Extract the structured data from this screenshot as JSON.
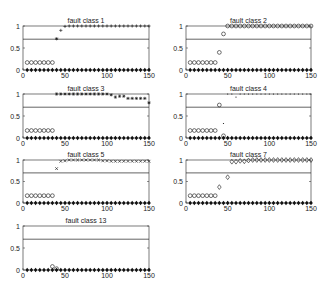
{
  "figure": {
    "background": "#ffffff",
    "line_color": "#222222",
    "marker_color": "#111111"
  },
  "chart_data": [
    {
      "type": "scatter",
      "title": "fault class 1",
      "xlim": [
        0,
        150
      ],
      "ylim": [
        0,
        1
      ],
      "xticks": [
        0,
        50,
        100,
        150
      ],
      "yticks": [
        0,
        0.5,
        1
      ],
      "threshold": 0.7,
      "grid": false,
      "series": [
        {
          "name": "normal",
          "marker": "diamond-filled",
          "x": "5..150 step 5",
          "y": "0 for all"
        },
        {
          "name": "pre-fault",
          "marker": "circle-open",
          "x": [
            5,
            10,
            15,
            20,
            25,
            30,
            35
          ],
          "y": [
            0.17,
            0.17,
            0.17,
            0.17,
            0.17,
            0.17,
            0.17
          ]
        },
        {
          "name": "transition",
          "marker": "asterisk",
          "x": [
            40
          ],
          "y": [
            0.71
          ]
        },
        {
          "name": "fault",
          "marker": "plus",
          "x": [
            45,
            50,
            55,
            60,
            65,
            70,
            75,
            80,
            85,
            90,
            95,
            100,
            105,
            110,
            115,
            120,
            125,
            130,
            135,
            140,
            145,
            150
          ],
          "y": [
            0.9,
            0.99,
            1,
            1,
            1,
            1,
            1,
            1,
            1,
            1,
            1,
            1,
            1,
            1,
            1,
            1,
            1,
            1,
            1,
            1,
            1,
            1
          ]
        }
      ]
    },
    {
      "type": "scatter",
      "title": "fault class 2",
      "xlim": [
        0,
        150
      ],
      "ylim": [
        0,
        1
      ],
      "xticks": [
        0,
        50,
        100,
        150
      ],
      "yticks": [
        0,
        0.5,
        1
      ],
      "threshold": 0.7,
      "grid": false,
      "series": [
        {
          "name": "normal",
          "marker": "diamond-filled",
          "x": "5..150 step 5",
          "y": "0 for all"
        },
        {
          "name": "pre-fault",
          "marker": "circle-open",
          "x": [
            5,
            10,
            15,
            20,
            25,
            30,
            35
          ],
          "y": [
            0.17,
            0.17,
            0.17,
            0.17,
            0.17,
            0.17,
            0.17
          ]
        },
        {
          "name": "fault",
          "marker": "circle-open",
          "x": [
            40,
            45,
            50,
            55,
            60,
            65,
            70,
            75,
            80,
            85,
            90,
            95,
            100,
            105,
            110,
            115,
            120,
            125,
            130,
            135,
            140,
            145,
            150
          ],
          "y": [
            0.4,
            0.82,
            1,
            1,
            1,
            1,
            1,
            1,
            1,
            1,
            1,
            1,
            1,
            1,
            1,
            1,
            1,
            1,
            1,
            1,
            1,
            1,
            1
          ]
        }
      ]
    },
    {
      "type": "scatter",
      "title": "fault class 3",
      "xlim": [
        0,
        150
      ],
      "ylim": [
        0,
        1
      ],
      "xticks": [
        0,
        50,
        100,
        150
      ],
      "yticks": [
        0,
        0.5,
        1
      ],
      "threshold": 0.7,
      "grid": false,
      "series": [
        {
          "name": "normal",
          "marker": "diamond-filled",
          "x": "5..150 step 5",
          "y": "0 for all"
        },
        {
          "name": "pre-fault",
          "marker": "circle-open",
          "x": [
            5,
            10,
            15,
            20,
            25,
            30,
            35
          ],
          "y": [
            0.17,
            0.17,
            0.17,
            0.17,
            0.17,
            0.17,
            0.17
          ]
        },
        {
          "name": "fault",
          "marker": "asterisk",
          "x": [
            40,
            45,
            50,
            55,
            60,
            65,
            70,
            75,
            80,
            85,
            90,
            95,
            100,
            105,
            110,
            115,
            120,
            125,
            130,
            135,
            140,
            145,
            150
          ],
          "y": [
            1,
            1,
            1,
            1,
            1,
            1,
            1,
            1,
            1,
            1,
            1,
            1,
            1,
            0.98,
            0.93,
            0.95,
            0.95,
            0.9,
            0.9,
            0.9,
            0.9,
            0.9,
            0.8
          ]
        }
      ]
    },
    {
      "type": "scatter",
      "title": "fault class 4",
      "xlim": [
        0,
        150
      ],
      "ylim": [
        0,
        1
      ],
      "xticks": [
        0,
        50,
        100,
        150
      ],
      "yticks": [
        0,
        0.5,
        1
      ],
      "threshold": 0.7,
      "grid": false,
      "series": [
        {
          "name": "normal",
          "marker": "diamond-filled",
          "x": "5..150 step 5",
          "y": "0 for all"
        },
        {
          "name": "pre-fault",
          "marker": "circle-open",
          "x": [
            5,
            10,
            15,
            20,
            25,
            30,
            35,
            40,
            45
          ],
          "y": [
            0.17,
            0.17,
            0.17,
            0.17,
            0.17,
            0.17,
            0.17,
            0.75,
            0.05
          ]
        },
        {
          "name": "fault",
          "marker": "dot",
          "x": [
            45,
            50,
            55,
            60,
            65,
            70,
            75,
            80,
            85,
            90,
            95,
            100,
            105,
            110,
            115,
            120,
            125,
            130,
            135,
            140,
            145,
            150
          ],
          "y": [
            0.33,
            1,
            1,
            0.93,
            1,
            1,
            1,
            1,
            1,
            1,
            1,
            1,
            1,
            1,
            1,
            1,
            1,
            1,
            1,
            1,
            1,
            1
          ]
        }
      ]
    },
    {
      "type": "scatter",
      "title": "fault class 5",
      "xlim": [
        0,
        150
      ],
      "ylim": [
        0,
        1
      ],
      "xticks": [
        0,
        50,
        100,
        150
      ],
      "yticks": [
        0,
        0.5,
        1
      ],
      "threshold": 0.7,
      "grid": false,
      "series": [
        {
          "name": "normal",
          "marker": "diamond-filled",
          "x": "5..150 step 5",
          "y": "0 for all"
        },
        {
          "name": "pre-fault",
          "marker": "circle-open",
          "x": [
            5,
            10,
            15,
            20,
            25,
            30,
            35
          ],
          "y": [
            0.17,
            0.17,
            0.17,
            0.17,
            0.17,
            0.17,
            0.17
          ]
        },
        {
          "name": "transition",
          "marker": "x",
          "x": [
            40
          ],
          "y": [
            0.8
          ]
        },
        {
          "name": "fault",
          "marker": "x",
          "x": [
            45,
            50,
            55,
            60,
            65,
            70,
            75,
            80,
            85,
            90,
            95,
            100,
            105,
            110,
            115,
            120,
            125,
            130,
            135,
            140,
            145,
            150
          ],
          "y": [
            0.97,
            0.98,
            1,
            1,
            1,
            1,
            1,
            1,
            1,
            1,
            0.98,
            0.98,
            0.97,
            0.97,
            0.97,
            0.97,
            0.97,
            0.97,
            0.97,
            0.97,
            0.97,
            0.97
          ]
        }
      ]
    },
    {
      "type": "scatter",
      "title": "fault class 7",
      "xlim": [
        0,
        150
      ],
      "ylim": [
        0,
        1
      ],
      "xticks": [
        0,
        50,
        100,
        150
      ],
      "yticks": [
        0,
        0.5,
        1
      ],
      "threshold": 0.7,
      "grid": false,
      "series": [
        {
          "name": "normal",
          "marker": "diamond-filled",
          "x": "5..150 step 5",
          "y": "0 for all"
        },
        {
          "name": "pre-fault",
          "marker": "circle-open",
          "x": [
            5,
            10,
            15,
            20,
            25,
            30,
            35
          ],
          "y": [
            0.17,
            0.17,
            0.17,
            0.17,
            0.17,
            0.17,
            0.17
          ]
        },
        {
          "name": "fault",
          "marker": "diamond-open",
          "x": [
            40,
            50,
            55,
            60,
            65,
            70,
            75,
            80,
            85,
            90,
            95,
            100,
            105,
            110,
            115,
            120,
            125,
            130,
            135,
            140,
            145,
            150
          ],
          "y": [
            0.37,
            0.6,
            0.96,
            0.96,
            0.98,
            0.97,
            0.99,
            1,
            1,
            1,
            1,
            1,
            1,
            1,
            1,
            1,
            1,
            1,
            1,
            1,
            1,
            1
          ]
        }
      ]
    },
    {
      "type": "scatter",
      "title": "fault class 13",
      "xlim": [
        0,
        150
      ],
      "ylim": [
        0,
        1
      ],
      "xticks": [
        0,
        50,
        100,
        150
      ],
      "yticks": [
        0,
        0.5,
        1
      ],
      "threshold": 0.7,
      "grid": false,
      "series": [
        {
          "name": "normal",
          "marker": "diamond-filled",
          "x": "5..150 step 5",
          "y": "0 for all"
        },
        {
          "name": "fault",
          "marker": "circle-open",
          "x": [
            35,
            40
          ],
          "y": [
            0.08,
            0.03
          ]
        }
      ]
    }
  ],
  "panels": [
    {
      "title": "fault class 1",
      "x0": 23,
      "x1": 149,
      "y1": 26,
      "y0": 70
    },
    {
      "title": "fault class 2",
      "x0": 186,
      "x1": 311,
      "y1": 26,
      "y0": 70
    },
    {
      "title": "fault class 3",
      "x0": 23,
      "x1": 149,
      "y1": 94,
      "y0": 138
    },
    {
      "title": "fault class 4",
      "x0": 186,
      "x1": 311,
      "y1": 94,
      "y0": 138
    },
    {
      "title": "fault class 5",
      "x0": 23,
      "x1": 149,
      "y1": 160,
      "y0": 203
    },
    {
      "title": "fault class 7",
      "x0": 186,
      "x1": 311,
      "y1": 160,
      "y0": 203
    },
    {
      "title": "fault class 13",
      "x0": 23,
      "x1": 149,
      "y1": 226,
      "y0": 270
    }
  ],
  "labels": {
    "xtick_labels": [
      "0",
      "50",
      "100",
      "150"
    ],
    "ytick_labels": [
      "0",
      "0.5",
      "1"
    ]
  }
}
